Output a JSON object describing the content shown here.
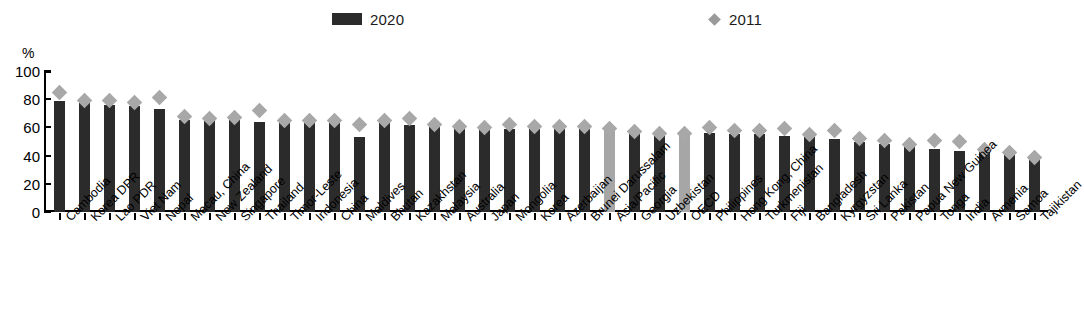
{
  "legend": {
    "items": [
      {
        "label": "2020",
        "marker": "bar-swatch-icon",
        "color": "#2b2b2b"
      },
      {
        "label": "2011",
        "marker": "diamond-marker-icon",
        "color": "#9a9a9a"
      }
    ]
  },
  "axis": {
    "unit_label": "%",
    "y_ticks": [
      "100",
      "80",
      "60",
      "40",
      "20",
      "0"
    ]
  },
  "colors": {
    "bar_2020": "#2b2b2b",
    "bar_highlight": "#a6a6a6",
    "diamond_2011": "#a8a8a8"
  },
  "chart_data": {
    "type": "bar",
    "title": "",
    "subtitle": "",
    "xlabel": "",
    "ylabel": "%",
    "ylim": [
      0,
      100
    ],
    "yticks": [
      0,
      20,
      40,
      60,
      80,
      100
    ],
    "grid": false,
    "legend_position": "top",
    "categories": [
      "Cambodia",
      "Korea DPR",
      "Lao PDR",
      "Viet Nam",
      "Nepal",
      "Macau, China",
      "New Zealand",
      "Singapore",
      "Thailand",
      "Timor-Leste",
      "Indonesia",
      "China",
      "Maldives",
      "Bhutan",
      "Kazakhstan",
      "Malaysia",
      "Australia",
      "Japan",
      "Mongolia",
      "Korea",
      "Azerbaijan",
      "Brunei Darussalam",
      "Asia/Pacific",
      "Georgia",
      "Uzbekistan",
      "OECD",
      "Philippines",
      "Hong Kong, China",
      "Turkmenistan",
      "Fiji",
      "Bangladesh",
      "Kyrgyzstan",
      "Sri Lanka",
      "Pakistan",
      "Papua New Guinea",
      "Tonga",
      "India",
      "Armenia",
      "Samoa",
      "Tajikistan"
    ],
    "highlighted": [
      "Asia/Pacific",
      "OECD"
    ],
    "series": [
      {
        "name": "2020",
        "marker": "bar",
        "values": [
          79,
          77,
          76,
          75,
          73,
          65,
          66,
          65,
          64,
          64,
          64,
          63,
          53,
          63,
          62,
          60,
          60,
          59,
          59,
          59,
          59,
          59,
          58,
          55,
          56,
          55,
          56,
          55,
          55,
          54,
          53,
          52,
          50,
          48,
          47,
          45,
          43,
          43,
          41,
          38
        ]
      },
      {
        "name": "2011",
        "marker": "diamond",
        "values": [
          85,
          79,
          79,
          78,
          81,
          68,
          66,
          67,
          72,
          65,
          65,
          65,
          62,
          65,
          66,
          62,
          61,
          60,
          62,
          61,
          61,
          61,
          59,
          57,
          56,
          56,
          60,
          58,
          58,
          59,
          55,
          58,
          52,
          51,
          48,
          51,
          50,
          44,
          42,
          39
        ]
      }
    ]
  }
}
